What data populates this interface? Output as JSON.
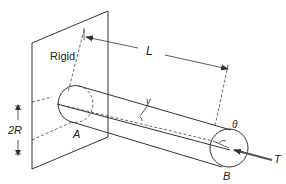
{
  "diagram": {
    "type": "torsion-of-cylindrical-bar",
    "labels": {
      "wall": "Rigid",
      "length": "L",
      "diameter": "2R",
      "end_fixed": "A",
      "end_free": "B",
      "shear_angle": "γ",
      "twist_angle": "θ",
      "torque": "T"
    },
    "colors": {
      "stroke": "#333333",
      "background": "#ffffff"
    }
  }
}
